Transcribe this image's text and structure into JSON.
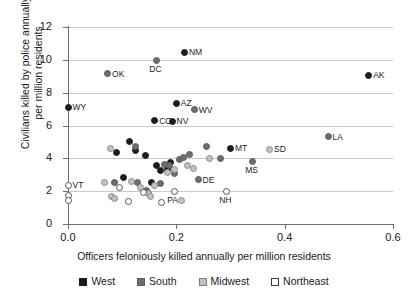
{
  "chart_data": {
    "type": "scatter",
    "title": "",
    "xlabel": "Officers feloniously killed annually per million residents",
    "ylabel": "Civilians killed by police annually\nper million residents",
    "xlim": [
      0.0,
      0.6
    ],
    "ylim": [
      0,
      12
    ],
    "xticks": [
      "0.0",
      "0.2",
      "0.4",
      "0.6"
    ],
    "xtick_values": [
      0.0,
      0.2,
      0.4,
      0.6
    ],
    "yticks": [
      "0",
      "2",
      "4",
      "6",
      "8",
      "10",
      "12"
    ],
    "ytick_values": [
      0,
      2,
      4,
      6,
      8,
      10,
      12
    ],
    "grid": "horizontal",
    "legend_position": "bottom",
    "legend": [
      {
        "name": "West",
        "color": "#1c1c1c",
        "marker": "filled-square-black"
      },
      {
        "name": "South",
        "color": "#6e6e6e",
        "marker": "filled-square-darkgray"
      },
      {
        "name": "Midwest",
        "color": "#c2c2c2",
        "marker": "filled-square-lightgray"
      },
      {
        "name": "Northeast",
        "color": "#ffffff",
        "marker": "open-square"
      }
    ],
    "series": [
      {
        "name": "West",
        "color": "#1c1c1c",
        "points": [
          {
            "label": "NM",
            "x": 0.215,
            "y": 10.45,
            "label_pos": "right"
          },
          {
            "label": "AK",
            "x": 0.555,
            "y": 9.05,
            "label_pos": "right"
          },
          {
            "label": "WY",
            "x": 0.0,
            "y": 7.1,
            "label_pos": "right"
          },
          {
            "label": "AZ",
            "x": 0.2,
            "y": 7.35,
            "label_pos": "right"
          },
          {
            "label": "CO",
            "x": 0.16,
            "y": 6.3,
            "label_pos": "right"
          },
          {
            "label": "NV",
            "x": 0.192,
            "y": 6.25,
            "label_pos": "right"
          },
          {
            "label": "MT",
            "x": 0.3,
            "y": 4.6,
            "label_pos": "right"
          },
          {
            "label": "",
            "x": 0.09,
            "y": 4.35,
            "label_pos": "none"
          },
          {
            "label": "",
            "x": 0.113,
            "y": 5.0,
            "label_pos": "none"
          },
          {
            "label": "",
            "x": 0.124,
            "y": 4.45,
            "label_pos": "none"
          },
          {
            "label": "",
            "x": 0.143,
            "y": 4.15,
            "label_pos": "none"
          },
          {
            "label": "",
            "x": 0.171,
            "y": 3.25,
            "label_pos": "none"
          },
          {
            "label": "",
            "x": 0.183,
            "y": 3.3,
            "label_pos": "none"
          },
          {
            "label": "",
            "x": 0.19,
            "y": 3.75,
            "label_pos": "none"
          },
          {
            "label": "",
            "x": 0.164,
            "y": 3.55,
            "label_pos": "none"
          },
          {
            "label": "",
            "x": 0.103,
            "y": 2.85,
            "label_pos": "none"
          },
          {
            "label": "",
            "x": 0.155,
            "y": 2.55,
            "label_pos": "none"
          }
        ]
      },
      {
        "name": "South",
        "color": "#6e6e6e",
        "points": [
          {
            "label": "OK",
            "x": 0.073,
            "y": 9.15,
            "label_pos": "right"
          },
          {
            "label": "DC",
            "x": 0.163,
            "y": 9.95,
            "label_pos": "below"
          },
          {
            "label": "WV",
            "x": 0.233,
            "y": 6.95,
            "label_pos": "right"
          },
          {
            "label": "LA",
            "x": 0.48,
            "y": 5.3,
            "label_pos": "right"
          },
          {
            "label": "MS",
            "x": 0.34,
            "y": 3.8,
            "label_pos": "below"
          },
          {
            "label": "DE",
            "x": 0.24,
            "y": 2.7,
            "label_pos": "right"
          },
          {
            "label": "",
            "x": 0.125,
            "y": 4.7,
            "label_pos": "none"
          },
          {
            "label": "",
            "x": 0.205,
            "y": 3.95,
            "label_pos": "none"
          },
          {
            "label": "",
            "x": 0.213,
            "y": 4.05,
            "label_pos": "none"
          },
          {
            "label": "",
            "x": 0.225,
            "y": 4.25,
            "label_pos": "none"
          },
          {
            "label": "",
            "x": 0.255,
            "y": 4.7,
            "label_pos": "none"
          },
          {
            "label": "",
            "x": 0.282,
            "y": 4.0,
            "label_pos": "none"
          },
          {
            "label": "",
            "x": 0.188,
            "y": 3.55,
            "label_pos": "none"
          },
          {
            "label": "",
            "x": 0.178,
            "y": 3.6,
            "label_pos": "none"
          },
          {
            "label": "",
            "x": 0.196,
            "y": 3.05,
            "label_pos": "none"
          },
          {
            "label": "",
            "x": 0.17,
            "y": 2.45,
            "label_pos": "none"
          },
          {
            "label": "",
            "x": 0.128,
            "y": 2.55,
            "label_pos": "none"
          },
          {
            "label": "",
            "x": 0.085,
            "y": 2.5,
            "label_pos": "none"
          },
          {
            "label": "",
            "x": 0.145,
            "y": 2.05,
            "label_pos": "none"
          },
          {
            "label": "",
            "x": 0.148,
            "y": 1.85,
            "label_pos": "none"
          }
        ]
      },
      {
        "name": "Midwest",
        "color": "#c2c2c2",
        "points": [
          {
            "label": "SD",
            "x": 0.372,
            "y": 4.55,
            "label_pos": "right"
          },
          {
            "label": "",
            "x": 0.078,
            "y": 4.6,
            "label_pos": "none"
          },
          {
            "label": "",
            "x": 0.22,
            "y": 3.55,
            "label_pos": "none"
          },
          {
            "label": "",
            "x": 0.232,
            "y": 3.4,
            "label_pos": "none"
          },
          {
            "label": "",
            "x": 0.262,
            "y": 4.0,
            "label_pos": "none"
          },
          {
            "label": "",
            "x": 0.196,
            "y": 3.3,
            "label_pos": "none"
          },
          {
            "label": "",
            "x": 0.183,
            "y": 3.15,
            "label_pos": "none"
          },
          {
            "label": "",
            "x": 0.068,
            "y": 2.55,
            "label_pos": "none"
          },
          {
            "label": "",
            "x": 0.118,
            "y": 2.6,
            "label_pos": "none"
          },
          {
            "label": "",
            "x": 0.133,
            "y": 2.25,
            "label_pos": "none"
          },
          {
            "label": "",
            "x": 0.16,
            "y": 2.35,
            "label_pos": "none"
          },
          {
            "label": "",
            "x": 0.148,
            "y": 1.85,
            "label_pos": "none"
          },
          {
            "label": "",
            "x": 0.152,
            "y": 1.7,
            "label_pos": "none"
          },
          {
            "label": "",
            "x": 0.08,
            "y": 1.65,
            "label_pos": "none"
          },
          {
            "label": "",
            "x": 0.086,
            "y": 1.55,
            "label_pos": "none"
          },
          {
            "label": "",
            "x": 0.21,
            "y": 1.45,
            "label_pos": "none"
          }
        ]
      },
      {
        "name": "Northeast",
        "color": "#ffffff",
        "points": [
          {
            "label": "VT",
            "x": 0.0,
            "y": 2.35,
            "label_pos": "right"
          },
          {
            "label": "PA",
            "x": 0.196,
            "y": 1.95,
            "label_pos": "below"
          },
          {
            "label": "NH",
            "x": 0.292,
            "y": 1.95,
            "label_pos": "below"
          },
          {
            "label": "",
            "x": 0.0,
            "y": 1.75,
            "label_pos": "none"
          },
          {
            "label": "",
            "x": 0.0,
            "y": 1.45,
            "label_pos": "none"
          },
          {
            "label": "",
            "x": 0.095,
            "y": 2.2,
            "label_pos": "none"
          },
          {
            "label": "",
            "x": 0.14,
            "y": 1.9,
            "label_pos": "none"
          },
          {
            "label": "",
            "x": 0.112,
            "y": 1.35,
            "label_pos": "none"
          },
          {
            "label": "",
            "x": 0.172,
            "y": 1.3,
            "label_pos": "none"
          }
        ]
      }
    ]
  }
}
